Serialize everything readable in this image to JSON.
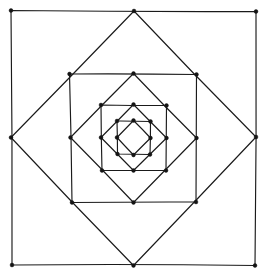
{
  "figure": {
    "title": "Nested rotated squares",
    "background_color": "#ffffff",
    "stroke_color": "#1a1a1a",
    "vertex_color": "#141414",
    "stroke_width": 1.15,
    "vertex_radius": 1.9,
    "canvas": {
      "width": 272,
      "height": 278
    },
    "center": {
      "x": 133.5,
      "y": 137.5
    },
    "level_count": 8
  },
  "chart_data": {
    "type": "line",
    "title": "Nested rotated squares",
    "xlabel": "",
    "ylabel": "",
    "xlim": [
      0,
      272
    ],
    "ylim": [
      0,
      278
    ],
    "grid": false,
    "legend": "none",
    "series": [
      {
        "name": "square-1-outer-axis-aligned",
        "orientation": "axis-aligned",
        "level": 1,
        "half_size": 122.5,
        "vertices": [
          {
            "x": 11.0,
            "y": 10.5
          },
          {
            "x": 256.0,
            "y": 11.5
          },
          {
            "x": 255.0,
            "y": 265.5
          },
          {
            "x": 12.0,
            "y": 265.0
          }
        ]
      },
      {
        "name": "square-2-diamond",
        "orientation": "diamond",
        "level": 2,
        "half_size": 126.5,
        "vertices": [
          {
            "x": 134.0,
            "y": 11.0
          },
          {
            "x": 256.0,
            "y": 137.0
          },
          {
            "x": 133.5,
            "y": 265.5
          },
          {
            "x": 11.0,
            "y": 137.5
          }
        ]
      },
      {
        "name": "square-3-axis-aligned",
        "orientation": "axis-aligned",
        "level": 3,
        "half_size": 63.5,
        "vertices": [
          {
            "x": 69.5,
            "y": 74.0
          },
          {
            "x": 196.5,
            "y": 74.5
          },
          {
            "x": 196.0,
            "y": 202.0
          },
          {
            "x": 72.0,
            "y": 202.5
          }
        ]
      },
      {
        "name": "square-4-diamond",
        "orientation": "diamond",
        "level": 4,
        "half_size": 64.5,
        "vertices": [
          {
            "x": 133.5,
            "y": 73.5
          },
          {
            "x": 196.5,
            "y": 138.0
          },
          {
            "x": 133.5,
            "y": 202.5
          },
          {
            "x": 70.5,
            "y": 137.5
          }
        ]
      },
      {
        "name": "square-5-axis-aligned",
        "orientation": "axis-aligned",
        "level": 5,
        "half_size": 33.0,
        "vertices": [
          {
            "x": 101.0,
            "y": 105.0
          },
          {
            "x": 166.5,
            "y": 105.5
          },
          {
            "x": 166.0,
            "y": 170.5
          },
          {
            "x": 102.0,
            "y": 170.5
          }
        ]
      },
      {
        "name": "square-6-diamond",
        "orientation": "diamond",
        "level": 6,
        "half_size": 33.0,
        "vertices": [
          {
            "x": 133.5,
            "y": 104.5
          },
          {
            "x": 166.5,
            "y": 138.0
          },
          {
            "x": 133.5,
            "y": 170.5
          },
          {
            "x": 101.0,
            "y": 137.5
          }
        ]
      },
      {
        "name": "square-7-axis-aligned",
        "orientation": "axis-aligned",
        "level": 7,
        "half_size": 17.0,
        "vertices": [
          {
            "x": 117.0,
            "y": 121.0
          },
          {
            "x": 150.5,
            "y": 121.5
          },
          {
            "x": 150.0,
            "y": 154.5
          },
          {
            "x": 117.5,
            "y": 154.0
          }
        ]
      },
      {
        "name": "square-8-inner-diamond",
        "orientation": "diamond",
        "level": 8,
        "half_size": 17.0,
        "vertices": [
          {
            "x": 133.5,
            "y": 120.5
          },
          {
            "x": 150.5,
            "y": 138.0
          },
          {
            "x": 133.5,
            "y": 155.0
          },
          {
            "x": 117.0,
            "y": 137.5
          }
        ]
      }
    ]
  }
}
